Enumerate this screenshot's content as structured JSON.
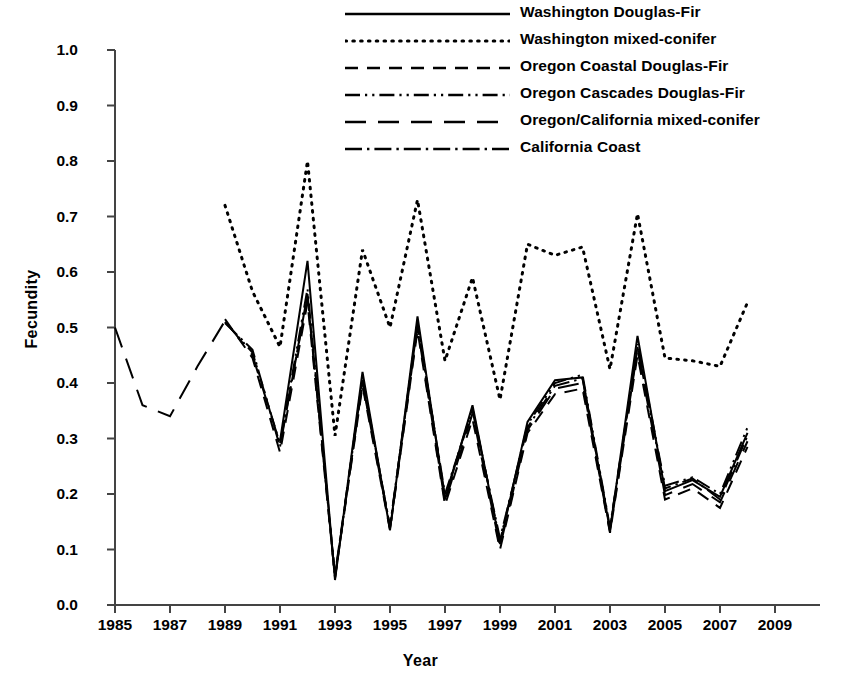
{
  "chart_data": {
    "type": "line",
    "title": "",
    "xlabel": "Year",
    "ylabel": "Fecundity",
    "xlim": [
      1984,
      2009.6
    ],
    "ylim": [
      0.0,
      1.0
    ],
    "grid": false,
    "legend_position": "top-center",
    "x_ticks": [
      1985,
      1987,
      1989,
      1991,
      1993,
      1995,
      1997,
      1999,
      2001,
      2003,
      2005,
      2007,
      2009
    ],
    "y_ticks": [
      "0.0",
      "0.1",
      "0.2",
      "0.3",
      "0.4",
      "0.5",
      "0.6",
      "0.7",
      "0.8",
      "0.9",
      "1.0"
    ],
    "series": [
      {
        "name": "Washington Douglas-Fir",
        "dash": "solid",
        "x": [
          1991,
          1992,
          1993,
          1994,
          1995,
          1996,
          1997,
          1998,
          1999,
          2000,
          2001,
          2002,
          2003,
          2004,
          2005,
          2006,
          2007,
          2008
        ],
        "values": [
          0.295,
          0.62,
          0.045,
          0.42,
          0.135,
          0.52,
          0.19,
          0.36,
          0.11,
          0.33,
          0.405,
          0.41,
          0.135,
          0.485,
          0.205,
          0.225,
          0.195,
          0.31
        ]
      },
      {
        "name": "Washington mixed-conifer",
        "dash": "dotted",
        "x": [
          1989,
          1990,
          1991,
          1992,
          1993,
          1994,
          1995,
          1996,
          1997,
          1998,
          1999,
          2000,
          2001,
          2002,
          2003,
          2004,
          2005,
          2006,
          2007,
          2008
        ],
        "values": [
          0.72,
          0.565,
          0.465,
          0.8,
          0.305,
          0.64,
          0.5,
          0.73,
          0.44,
          0.59,
          0.37,
          0.65,
          0.63,
          0.645,
          0.425,
          0.705,
          0.445,
          0.44,
          0.43,
          0.545
        ]
      },
      {
        "name": "Oregon Coastal Douglas-Fir",
        "dash": "dashed",
        "x": [
          1989,
          1990,
          1991,
          1992,
          1993,
          1994,
          1995,
          1996,
          1997,
          1998,
          1999,
          2000,
          2001,
          2002,
          2003,
          2004,
          2005,
          2006,
          2007,
          2008
        ],
        "values": [
          0.515,
          0.445,
          0.275,
          0.545,
          0.05,
          0.395,
          0.135,
          0.495,
          0.18,
          0.335,
          0.1,
          0.31,
          0.38,
          0.39,
          0.13,
          0.45,
          0.19,
          0.21,
          0.175,
          0.285
        ]
      },
      {
        "name": "Oregon Cascades Douglas-Fir",
        "dash": "dash-dot-dot",
        "x": [
          1989,
          1990,
          1991,
          1992,
          1993,
          1994,
          1995,
          1996,
          1997,
          1998,
          1999,
          2000,
          2001,
          2002,
          2003,
          2004,
          2005,
          2006,
          2007,
          2008
        ],
        "values": [
          0.51,
          0.455,
          0.29,
          0.57,
          0.048,
          0.41,
          0.14,
          0.51,
          0.195,
          0.355,
          0.115,
          0.325,
          0.4,
          0.415,
          0.14,
          0.47,
          0.215,
          0.23,
          0.2,
          0.32
        ]
      },
      {
        "name": "Oregon/California mixed-conifer",
        "dash": "long-dash",
        "x": [
          1985,
          1986,
          1987,
          1988,
          1989,
          1990,
          1991,
          1992,
          1993,
          1994,
          1995,
          1996,
          1997,
          1998,
          1999,
          2000,
          2001,
          2002,
          2003,
          2004,
          2005,
          2006,
          2007,
          2008
        ],
        "values": [
          0.5,
          0.36,
          0.34,
          0.43,
          0.512,
          0.45,
          0.29,
          0.555,
          0.052,
          0.4,
          0.138,
          0.5,
          0.185,
          0.345,
          0.105,
          0.315,
          0.39,
          0.4,
          0.132,
          0.46,
          0.198,
          0.218,
          0.185,
          0.295
        ]
      },
      {
        "name": "California Coast",
        "dash": "dash-dot",
        "x": [
          1989,
          1990,
          1991,
          1992,
          1993,
          1994,
          1995,
          1996,
          1997,
          1998,
          1999,
          2000,
          2001,
          2002,
          2003,
          2004,
          2005,
          2006,
          2007,
          2008
        ],
        "values": [
          0.508,
          0.46,
          0.285,
          0.56,
          0.055,
          0.405,
          0.142,
          0.505,
          0.2,
          0.35,
          0.12,
          0.32,
          0.395,
          0.408,
          0.138,
          0.465,
          0.21,
          0.228,
          0.19,
          0.305
        ]
      }
    ]
  },
  "legend": {
    "items": [
      {
        "label": "Washington Douglas-Fir",
        "dash": "solid"
      },
      {
        "label": "Washington mixed-conifer",
        "dash": "dotted"
      },
      {
        "label": "Oregon Coastal Douglas-Fir",
        "dash": "dashed"
      },
      {
        "label": "Oregon Cascades Douglas-Fir",
        "dash": "dash-dot-dot"
      },
      {
        "label": "Oregon/California mixed-conifer",
        "dash": "long-dash"
      },
      {
        "label": "California Coast",
        "dash": "dash-dot"
      }
    ]
  },
  "axes": {
    "y_title": "Fecundity",
    "x_title": "Year",
    "y_tick_labels": [
      "1.0",
      "0.9",
      "0.8",
      "0.7",
      "0.6",
      "0.5",
      "0.4",
      "0.3",
      "0.2",
      "0.1",
      "0.0"
    ],
    "x_tick_labels": [
      "1985",
      "1987",
      "1989",
      "1991",
      "1993",
      "1995",
      "1997",
      "1999",
      "2001",
      "2003",
      "2005",
      "2007",
      "2009"
    ]
  },
  "colors": {
    "ink": "#000000",
    "background": "#ffffff"
  }
}
